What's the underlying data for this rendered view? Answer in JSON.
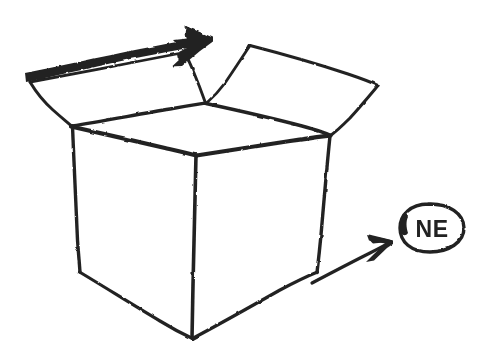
{
  "canvas": {
    "width": 501,
    "height": 358,
    "background_color": "#ffffff",
    "ink_color": "#232323",
    "medium": "hand-drawn-marker-sketch"
  },
  "drawing": {
    "title": "open-cardboard-box-with-arrows",
    "subject": "open box in three-quarter perspective with two outward arrows and a circled NE label"
  },
  "label": {
    "text": "NE",
    "shape": "ellipse",
    "center_x": 432,
    "center_y": 228,
    "radius_x": 32,
    "radius_y": 24,
    "font_size": 23
  },
  "box": {
    "body": {
      "top_left_x": 72,
      "top_left_y": 126,
      "top_center_x": 196,
      "top_center_y": 155,
      "top_right_x": 330,
      "top_right_y": 135,
      "bottom_left_x": 80,
      "bottom_left_y": 272,
      "bottom_center_x": 192,
      "bottom_center_y": 338,
      "bottom_right_x": 317,
      "bottom_right_y": 272
    },
    "flap_left": {
      "outer_corner_x": 30,
      "outer_corner_y": 82,
      "junction_x": 205,
      "junction_y": 103
    },
    "flap_right": {
      "outer_corner_x": 378,
      "outer_corner_y": 85,
      "near_corner_x": 250,
      "near_corner_y": 45
    }
  },
  "arrows": {
    "top_arrow": {
      "name": "thick-up-right-arrow",
      "tail_x": 25,
      "tail_y": 74,
      "tip_x": 212,
      "tip_y": 38,
      "weight": "thick"
    },
    "lower_arrow": {
      "name": "thin-up-right-arrow",
      "tail_x": 312,
      "tail_y": 282,
      "tip_x": 392,
      "tip_y": 241,
      "weight": "thin"
    }
  }
}
